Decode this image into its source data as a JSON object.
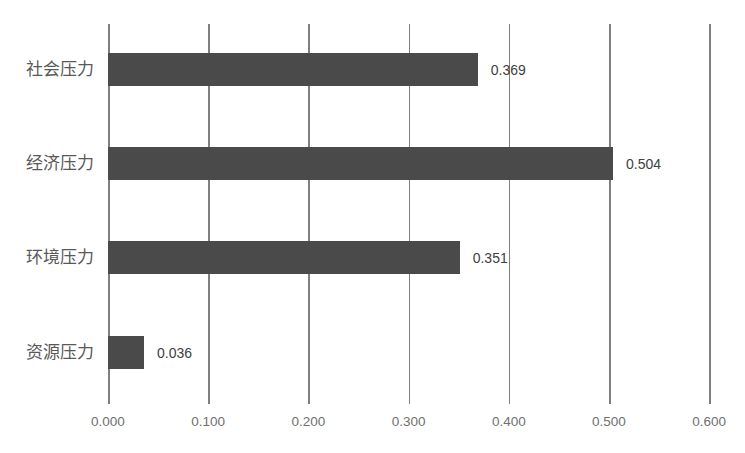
{
  "chart_data": {
    "type": "bar",
    "orientation": "horizontal",
    "title": "",
    "xlabel": "",
    "ylabel": "",
    "categories": [
      "社会压力",
      "经济压力",
      "环境压力",
      "资源压力"
    ],
    "values": [
      0.369,
      0.504,
      0.351,
      0.036
    ],
    "value_labels": [
      "0.369",
      "0.504",
      "0.351",
      "0.036"
    ],
    "xlim": [
      0,
      0.6
    ],
    "x_ticks": [
      "0.000",
      "0.100",
      "0.200",
      "0.300",
      "0.400",
      "0.500",
      "0.600"
    ],
    "grid": "vertical",
    "legend": "none",
    "bar_color": "#4a4a4a",
    "grid_color": "#7f7f7f"
  }
}
